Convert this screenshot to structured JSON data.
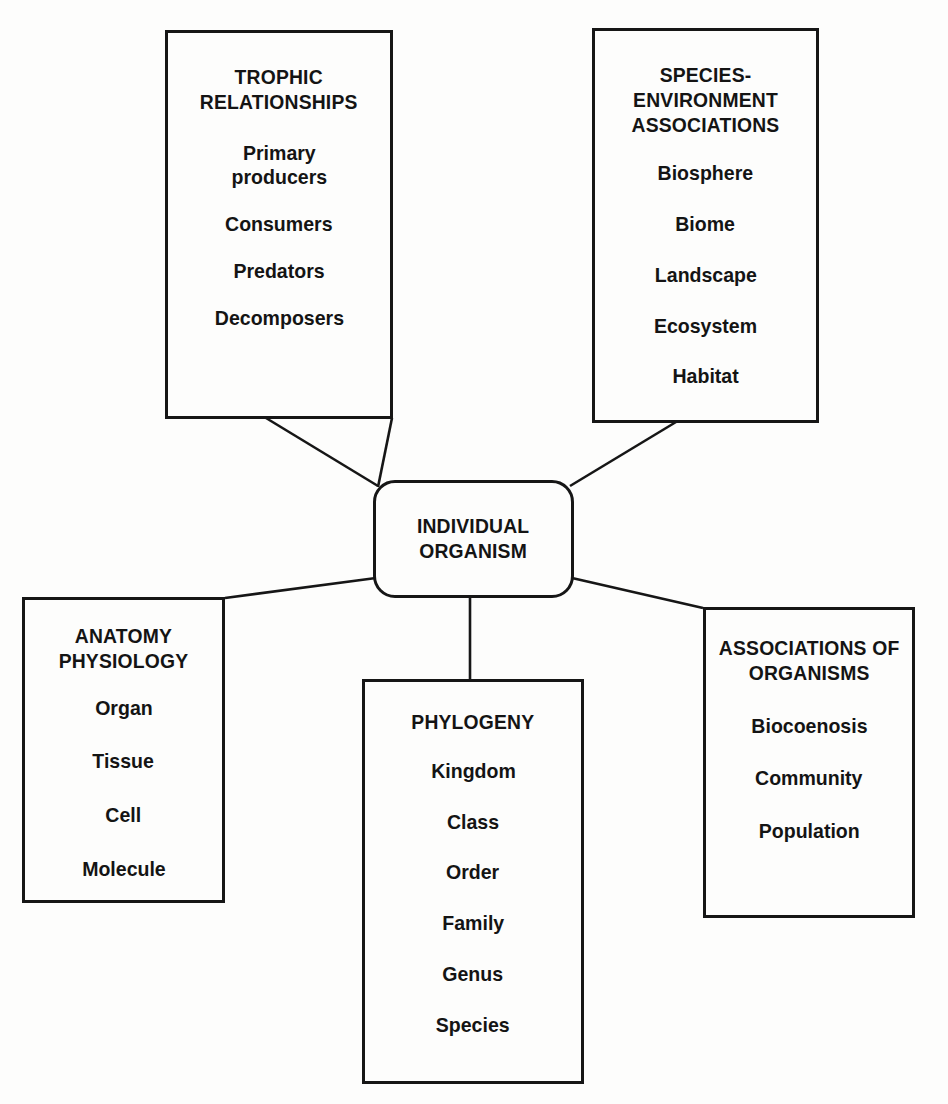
{
  "diagram": {
    "type": "hub-and-spoke",
    "center": {
      "title_lines": [
        "INDIVIDUAL",
        "ORGANISM"
      ],
      "shape": "rounded-rectangle"
    },
    "nodes": [
      {
        "id": "trophic",
        "title_lines": [
          "TROPHIC",
          "RELATIONSHIPS"
        ],
        "items": [
          "Primary\nproducers",
          "Consumers",
          "Predators",
          "Decomposers"
        ],
        "position": "top-left"
      },
      {
        "id": "species",
        "title_lines": [
          "SPECIES-ENVIRONMENT",
          "ASSOCIATIONS"
        ],
        "items": [
          "Biosphere",
          "Biome",
          "Landscape",
          "Ecosystem",
          "Habitat"
        ],
        "position": "top-right"
      },
      {
        "id": "anatomy",
        "title_lines": [
          "ANATOMY",
          "PHYSIOLOGY"
        ],
        "items": [
          "Organ",
          "Tissue",
          "Cell",
          "Molecule"
        ],
        "position": "bottom-left"
      },
      {
        "id": "phylogeny",
        "title_lines": [
          "PHYLOGENY"
        ],
        "items": [
          "Kingdom",
          "Class",
          "Order",
          "Family",
          "Genus",
          "Species"
        ],
        "position": "bottom-center"
      },
      {
        "id": "associations",
        "title_lines": [
          "ASSOCIATIONS OF",
          "ORGANISMS"
        ],
        "items": [
          "Biocoenosis",
          "Community",
          "Population"
        ],
        "position": "bottom-right"
      }
    ],
    "colors": {
      "stroke": "#161616",
      "background": "#fdfdfc",
      "text": "#141414"
    },
    "connectors": [
      {
        "from": "center",
        "to": "trophic",
        "style": "line"
      },
      {
        "from": "center",
        "to": "species",
        "style": "line"
      },
      {
        "from": "center",
        "to": "anatomy",
        "style": "line"
      },
      {
        "from": "center",
        "to": "phylogeny",
        "style": "line"
      },
      {
        "from": "center",
        "to": "associations",
        "style": "line"
      }
    ]
  }
}
